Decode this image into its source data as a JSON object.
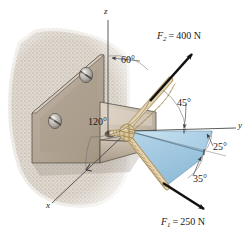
{
  "figure": {
    "kind": "statics-free-body-diagram",
    "axes": {
      "z_label": "z",
      "y_label": "y",
      "x_label": "x"
    },
    "angles": [
      {
        "name": "angle-60",
        "text": "60°",
        "value": 60,
        "unit": "deg",
        "measured_from": "z-axis",
        "applies_to": "F2"
      },
      {
        "name": "angle-45",
        "text": "45°",
        "value": 45,
        "unit": "deg",
        "measured_from": "y-axis",
        "applies_to": "F2"
      },
      {
        "name": "angle-120",
        "text": "120°",
        "value": 120,
        "unit": "deg",
        "measured_from": "x-axis",
        "applies_to": "F2"
      },
      {
        "name": "angle-25",
        "text": "25°",
        "value": 25,
        "unit": "deg",
        "measured_from": "y-axis",
        "applies_to": "F1-horizontal-projection"
      },
      {
        "name": "angle-35",
        "text": "35°",
        "value": 35,
        "unit": "deg",
        "measured_from": "xy-plane",
        "applies_to": "F1"
      }
    ],
    "forces": [
      {
        "name": "force-F2",
        "symbol": "F",
        "subscript": "2",
        "equals": "=",
        "magnitude": "400",
        "unit": "N",
        "label": "F2 = 400 N",
        "value": 400
      },
      {
        "name": "force-F1",
        "symbol": "F",
        "subscript": "1",
        "equals": "=",
        "magnitude": "250",
        "unit": "N",
        "label": "F1 = 250 N",
        "value": 250
      }
    ],
    "parts": [
      {
        "name": "concrete-wall",
        "label": "concrete wall"
      },
      {
        "name": "angle-bracket",
        "label": "steel angle bracket"
      },
      {
        "name": "bolt-upper",
        "label": "bolt"
      },
      {
        "name": "bolt-lower",
        "label": "bolt"
      },
      {
        "name": "rope-knot",
        "label": "rope knot"
      },
      {
        "name": "rope-upper",
        "label": "rope to F2"
      },
      {
        "name": "rope-lower",
        "label": "rope to F1"
      },
      {
        "name": "projection-plane",
        "label": "shaded projection plane"
      }
    ],
    "colors": {
      "wall": "#d9d2c8",
      "wall_speckle": "#bfb6aa",
      "bracket_face": "#b6a999",
      "bracket_top": "#cfc4b5",
      "bracket_side": "#9d9081",
      "rope": "#d8c49a",
      "rope_shadow": "#a8916a",
      "shade_blue": "#b9d7ea",
      "shade_blue_dark": "#9ec5de",
      "arrow": "#111111",
      "axis_line": "#4a4a4a",
      "label_text": "#1a1a1a",
      "background": "#ffffff"
    }
  }
}
